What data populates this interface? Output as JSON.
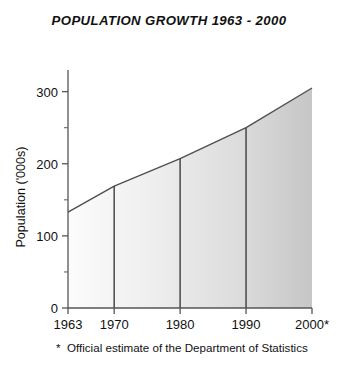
{
  "chart_data": {
    "type": "area",
    "title": "POPULATION GROWTH 1963 - 2000",
    "xlabel": "",
    "ylabel": "Population ('000s)",
    "x": [
      1963,
      1970,
      1980,
      1990,
      2000
    ],
    "values": [
      133,
      169,
      207,
      250,
      305
    ],
    "xtick_labels": [
      "1963",
      "1970",
      "1980",
      "1990",
      "2000*"
    ],
    "ytick_labels": [
      "0",
      "100",
      "200",
      "300"
    ],
    "yticks": [
      0,
      100,
      200,
      300
    ],
    "yminor_ticks": [
      50,
      150,
      250
    ],
    "xlim": [
      1963,
      2000
    ],
    "ylim": [
      0,
      330
    ],
    "grid": false,
    "legend": "none",
    "drop_lines_at": [
      1970,
      1980,
      1990
    ],
    "fill_gradient": {
      "left_color": "#fbfbfb",
      "right_color": "#c9c9c9"
    },
    "line_color": "#4a4a4a",
    "axis_color": "#555555",
    "annotations": [
      {
        "marker": "*",
        "text": "Official estimate of the Department of Statistics"
      }
    ]
  },
  "footnote": {
    "marker": "*",
    "text": "Official estimate of the Department of Statistics"
  }
}
